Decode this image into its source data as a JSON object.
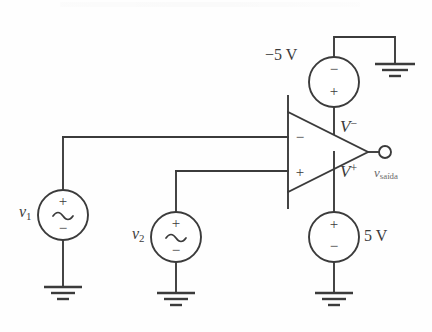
{
  "figure": {
    "type": "circuit-schematic",
    "width": 432,
    "height": 332,
    "line_color": "#3b3b3b",
    "background_color": "#fefefe"
  },
  "opamp": {
    "name": "operational-amplifier",
    "inverting_input_symbol": "−",
    "noninverting_input_symbol": "+",
    "negative_rail_label": "V",
    "negative_rail_sup": "−",
    "positive_rail_label": "V",
    "positive_rail_sup": "+"
  },
  "sources": [
    {
      "id": "v1",
      "kind": "ac",
      "label": "v",
      "label_sub": "1",
      "terminal_top": "+",
      "terminal_bottom": "−",
      "inner_symbol": "sine-wave"
    },
    {
      "id": "v2",
      "kind": "ac",
      "label": "v",
      "label_sub": "2",
      "terminal_top": "+",
      "terminal_bottom": "−",
      "inner_symbol": "sine-wave"
    },
    {
      "id": "supply-negative",
      "kind": "dc",
      "label": "−5 V",
      "terminal_top": "−",
      "terminal_bottom": "+"
    },
    {
      "id": "supply-positive",
      "kind": "dc",
      "label": "5 V",
      "terminal_top": "+",
      "terminal_bottom": "−"
    }
  ],
  "output": {
    "label": "v",
    "label_sub": "saída",
    "terminal": "open-circle"
  },
  "grounds": [
    {
      "id": "ground-v1"
    },
    {
      "id": "ground-v2"
    },
    {
      "id": "ground-supply-positive"
    },
    {
      "id": "ground-supply-negative"
    }
  ]
}
